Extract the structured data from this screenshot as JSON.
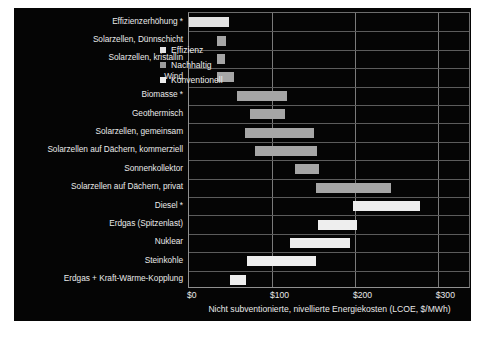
{
  "chart_data": {
    "type": "bar",
    "subtype": "floating-range-bar",
    "title": "",
    "xlabel": "Nicht subventionierte, nivellierte Energiekosten (LCOE, $/MWh)",
    "ylabel": "",
    "xlim": [
      0,
      340
    ],
    "xticks": [
      0,
      100,
      200,
      300
    ],
    "xticklabels": [
      "$0",
      "$100",
      "$200",
      "$300"
    ],
    "grid": true,
    "legend_position": "inside-top-right",
    "categories": [
      "Effizienzerhöhung *",
      "Solarzellen, Dünnschicht",
      "Solarzellen, kristallin",
      "Wind",
      "Biomasse *",
      "Geothermisch",
      "Solarzellen, gemeinsam",
      "Solarzellen auf Dächern, kommerziell",
      "Sonnenkollektor",
      "Solarzellen auf Dächern, privat",
      "Diesel *",
      "Erdgas (Spitzenlast)",
      "Nuklear",
      "Steinkohle",
      "Erdgas + Kraft-Wärme-Kopplung"
    ],
    "series": [
      {
        "name": "Effizienz",
        "color": "#e3e3e3",
        "bars": [
          {
            "category": "Effizienzerhöhung *",
            "low": 0,
            "high": 48
          }
        ]
      },
      {
        "name": "Nachhaltig",
        "color": "#a6a6a6",
        "bars": [
          {
            "category": "Solarzellen, Dünnschicht",
            "low": 34,
            "high": 45
          },
          {
            "category": "Solarzellen, kristallin",
            "low": 34,
            "high": 43
          },
          {
            "category": "Wind",
            "low": 34,
            "high": 54
          },
          {
            "category": "Biomasse *",
            "low": 58,
            "high": 118
          },
          {
            "category": "Geothermisch",
            "low": 73,
            "high": 116
          },
          {
            "category": "Solarzellen, gemeinsam",
            "low": 67,
            "high": 151
          },
          {
            "category": "Solarzellen auf Dächern, kommerziell",
            "low": 79,
            "high": 154
          },
          {
            "category": "Sonnenkollektor",
            "low": 128,
            "high": 157
          },
          {
            "category": "Solarzellen auf Dächern, privat",
            "low": 153,
            "high": 244
          }
        ]
      },
      {
        "name": "Konventionell",
        "color": "#eeeeee",
        "bars": [
          {
            "category": "Diesel *",
            "low": 198,
            "high": 278
          },
          {
            "category": "Erdgas (Spitzenlast)",
            "low": 155,
            "high": 202
          },
          {
            "category": "Nuklear",
            "low": 122,
            "high": 194
          },
          {
            "category": "Steinkohle",
            "low": 70,
            "high": 153
          },
          {
            "category": "Erdgas + Kraft-Wärme-Kopplung",
            "low": 49,
            "high": 69
          }
        ]
      }
    ],
    "bars_in_order": [
      {
        "category": "Effizienzerhöhung *",
        "low": 0,
        "high": 48,
        "series": "Effizienz",
        "color": "#e3e3e3"
      },
      {
        "category": "Solarzellen, Dünnschicht",
        "low": 34,
        "high": 45,
        "series": "Nachhaltig",
        "color": "#a6a6a6"
      },
      {
        "category": "Solarzellen, kristallin",
        "low": 34,
        "high": 43,
        "series": "Nachhaltig",
        "color": "#a6a6a6"
      },
      {
        "category": "Wind",
        "low": 34,
        "high": 54,
        "series": "Nachhaltig",
        "color": "#a6a6a6"
      },
      {
        "category": "Biomasse *",
        "low": 58,
        "high": 118,
        "series": "Nachhaltig",
        "color": "#a6a6a6"
      },
      {
        "category": "Geothermisch",
        "low": 73,
        "high": 116,
        "series": "Nachhaltig",
        "color": "#a6a6a6"
      },
      {
        "category": "Solarzellen, gemeinsam",
        "low": 67,
        "high": 151,
        "series": "Nachhaltig",
        "color": "#a6a6a6"
      },
      {
        "category": "Solarzellen auf Dächern, kommerziell",
        "low": 79,
        "high": 154,
        "series": "Nachhaltig",
        "color": "#a6a6a6"
      },
      {
        "category": "Sonnenkollektor",
        "low": 128,
        "high": 157,
        "series": "Nachhaltig",
        "color": "#a6a6a6"
      },
      {
        "category": "Solarzellen auf Dächern, privat",
        "low": 153,
        "high": 244,
        "series": "Nachhaltig",
        "color": "#a6a6a6"
      },
      {
        "category": "Diesel *",
        "low": 198,
        "high": 278,
        "series": "Konventionell",
        "color": "#eeeeee"
      },
      {
        "category": "Erdgas (Spitzenlast)",
        "low": 155,
        "high": 202,
        "series": "Konventionell",
        "color": "#eeeeee"
      },
      {
        "category": "Nuklear",
        "low": 122,
        "high": 194,
        "series": "Konventionell",
        "color": "#eeeeee"
      },
      {
        "category": "Steinkohle",
        "low": 70,
        "high": 153,
        "series": "Konventionell",
        "color": "#eeeeee"
      },
      {
        "category": "Erdgas + Kraft-Wärme-Kopplung",
        "low": 49,
        "high": 69,
        "series": "Konventionell",
        "color": "#eeeeee"
      }
    ],
    "legend": [
      {
        "label": "Effizienz",
        "color": "#e3e3e3"
      },
      {
        "label": "Nachhaltig",
        "color": "#9b9b9b"
      },
      {
        "label": "Konventionell",
        "color": "#ededed"
      }
    ],
    "colors": {
      "background": "#050505",
      "text": "#e9e9e9",
      "gridline": "#7a7a7a",
      "page": "#ffffff"
    }
  }
}
